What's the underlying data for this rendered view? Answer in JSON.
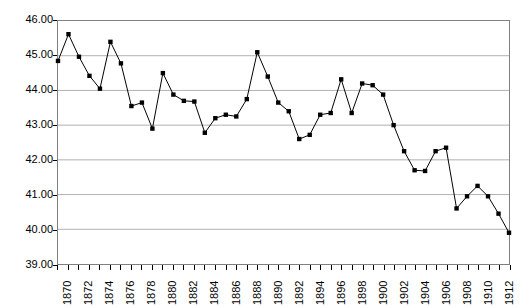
{
  "chart_data": {
    "type": "line",
    "title": "",
    "subtitle": "",
    "xlabel": "",
    "ylabel": "",
    "ylim": [
      39.0,
      46.0
    ],
    "xlim": [
      1870,
      1913
    ],
    "grid": true,
    "grid_axis": "y",
    "legend": false,
    "legend_position": "none",
    "marker": "square",
    "marker_color": "#000000",
    "line_color": "#000000",
    "y_ticks": [
      39.0,
      40.0,
      41.0,
      42.0,
      43.0,
      44.0,
      45.0,
      46.0
    ],
    "y_tick_labels": [
      "39.00",
      "40.00",
      "41.00",
      "42.00",
      "43.00",
      "44.00",
      "45.00",
      "46.00"
    ],
    "x_tick_labels": [
      "1870",
      "1872",
      "1874",
      "1876",
      "1878",
      "1880",
      "1882",
      "1884",
      "1886",
      "1888",
      "1890",
      "1892",
      "1894",
      "1896",
      "1898",
      "1900",
      "1902",
      "1904",
      "1906",
      "1908",
      "1910",
      "1912"
    ],
    "x": [
      1870,
      1871,
      1872,
      1873,
      1874,
      1875,
      1876,
      1877,
      1878,
      1879,
      1880,
      1881,
      1882,
      1883,
      1884,
      1885,
      1886,
      1887,
      1888,
      1889,
      1890,
      1891,
      1892,
      1893,
      1894,
      1895,
      1896,
      1897,
      1898,
      1899,
      1900,
      1901,
      1902,
      1903,
      1904,
      1905,
      1906,
      1907,
      1908,
      1909,
      1910,
      1911,
      1912,
      1913
    ],
    "values": [
      44.85,
      45.62,
      44.97,
      44.42,
      44.05,
      45.4,
      44.78,
      43.55,
      43.65,
      42.9,
      44.5,
      43.88,
      43.7,
      43.68,
      42.78,
      43.2,
      43.3,
      43.25,
      43.75,
      45.1,
      44.4,
      43.65,
      43.4,
      42.6,
      42.72,
      43.3,
      43.35,
      44.32,
      43.35,
      44.2,
      44.15,
      43.88,
      43.0,
      42.25,
      41.7,
      41.68,
      42.25,
      42.35,
      40.6,
      40.95,
      41.25,
      40.95,
      40.45,
      39.9
    ],
    "series": [
      {
        "name": "series-1",
        "values": [
          44.85,
          45.62,
          44.97,
          44.42,
          44.05,
          45.4,
          44.78,
          43.55,
          43.65,
          42.9,
          44.5,
          43.88,
          43.7,
          43.68,
          42.78,
          43.2,
          43.3,
          43.25,
          43.75,
          45.1,
          44.4,
          43.65,
          43.4,
          42.6,
          42.72,
          43.3,
          43.35,
          44.32,
          43.35,
          44.2,
          44.15,
          43.88,
          43.0,
          42.25,
          41.7,
          41.68,
          42.25,
          42.35,
          40.6,
          40.95,
          41.25,
          40.95,
          40.45,
          39.9
        ]
      }
    ],
    "colors": {
      "line": "#000000",
      "marker": "#000000",
      "grid": "#b0b0b0",
      "frame": "#808080",
      "text": "#000000",
      "background": "#ffffff"
    }
  }
}
